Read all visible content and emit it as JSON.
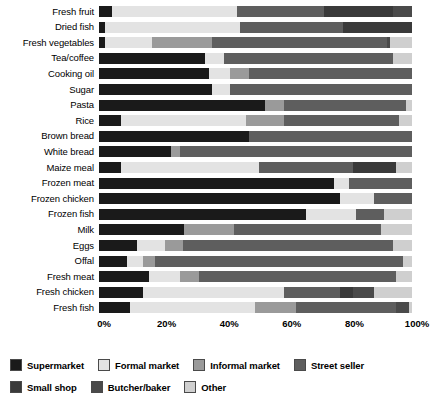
{
  "chart_data": {
    "type": "bar",
    "orientation": "horizontal",
    "stacked": true,
    "normalized": true,
    "title": "",
    "subtitle": "",
    "xlabel": "",
    "ylabel": "",
    "xlim": [
      0,
      100
    ],
    "xunit": "%",
    "grid": false,
    "legend_position": "bottom-left",
    "xticks": [
      "0%",
      "20%",
      "40%",
      "60%",
      "80%",
      "100%"
    ],
    "xtick_values": [
      0,
      20,
      40,
      60,
      80,
      100
    ],
    "categories": [
      "Fresh fruit",
      "Dried fish",
      "Fresh vegetables",
      "Tea/coffee",
      "Cooking oil",
      "Sugar",
      "Pasta",
      "Rice",
      "Brown bread",
      "White bread",
      "Maize meal",
      "Frozen meat",
      "Frozen chicken",
      "Frozen fish",
      "Milk",
      "Eggs",
      "Offal",
      "Fresh meat",
      "Fresh chicken",
      "Fresh fish"
    ],
    "series": [
      {
        "name": "Supermarket",
        "color": "#1a1a1a",
        "values": [
          4,
          2,
          2,
          34,
          35,
          36,
          53,
          7,
          48,
          23,
          7,
          75,
          77,
          66,
          27,
          12,
          9,
          16,
          14,
          10
        ]
      },
      {
        "name": "Formal market",
        "color": "#e3e3e3",
        "values": [
          40,
          43,
          15,
          6,
          7,
          6,
          0,
          40,
          0,
          0,
          44,
          5,
          11,
          16,
          0,
          9,
          5,
          10,
          45,
          40
        ]
      },
      {
        "name": "Informal market",
        "color": "#9a9a9a",
        "values": [
          0,
          0,
          19,
          0,
          6,
          0,
          6,
          12,
          0,
          3,
          0,
          0,
          0,
          0,
          16,
          6,
          4,
          6,
          0,
          13
        ]
      },
      {
        "name": "Street seller",
        "color": "#5e5e5e",
        "values": [
          28,
          33,
          56,
          54,
          52,
          58,
          39,
          37,
          52,
          74,
          30,
          20,
          12,
          9,
          47,
          67,
          79,
          63,
          18,
          32
        ]
      },
      {
        "name": "Small shop",
        "color": "#3a3a3a",
        "values": [
          22,
          22,
          0,
          0,
          0,
          0,
          0,
          0,
          0,
          0,
          14,
          0,
          0,
          0,
          0,
          0,
          0,
          0,
          4,
          0
        ]
      },
      {
        "name": "Butcher/baker",
        "color": "#4a4a4a",
        "values": [
          6,
          0,
          1,
          0,
          0,
          0,
          0,
          0,
          0,
          0,
          0,
          0,
          0,
          0,
          0,
          0,
          0,
          0,
          7,
          4
        ]
      },
      {
        "name": "Other",
        "color": "#cfcfcf",
        "values": [
          0,
          0,
          7,
          6,
          0,
          0,
          2,
          4,
          0,
          0,
          5,
          0,
          0,
          9,
          10,
          6,
          3,
          5,
          12,
          1
        ]
      }
    ]
  },
  "legend": {
    "items": [
      {
        "label": "Supermarket",
        "color": "#1a1a1a"
      },
      {
        "label": "Formal market",
        "color": "#e3e3e3"
      },
      {
        "label": "Informal market",
        "color": "#9a9a9a"
      },
      {
        "label": "Street seller",
        "color": "#5e5e5e"
      },
      {
        "label": "Small shop",
        "color": "#3a3a3a"
      },
      {
        "label": "Butcher/baker",
        "color": "#4a4a4a"
      },
      {
        "label": "Other",
        "color": "#cfcfcf"
      }
    ]
  }
}
